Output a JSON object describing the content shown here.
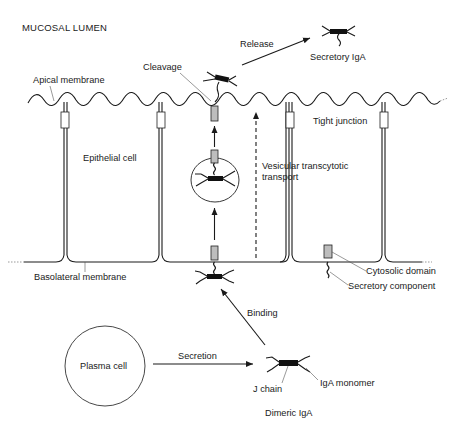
{
  "regions": {
    "lumen": "MUCOSAL LUMEN"
  },
  "labels": {
    "apical_membrane": "Apical membrane",
    "cleavage": "Cleavage",
    "release": "Release",
    "secretory_iga": "Secretory IgA",
    "tight_junction": "Tight junction",
    "epithelial_cell": "Epithelial cell",
    "vesicular_line1": "Vesicular transcytotic",
    "vesicular_line2": "transport",
    "basolateral_membrane": "Basolateral membrane",
    "cytosolic_domain": "Cytosolic domain",
    "secretory_component": "Secretory component",
    "binding": "Binding",
    "plasma_cell": "Plasma cell",
    "secretion": "Secretion",
    "j_chain": "J chain",
    "iga_monomer": "IgA monomer",
    "dimeric_iga": "Dimeric IgA"
  },
  "colors": {
    "ink": "#1a1a1a",
    "secretory_component_fill": "#bdbdbd",
    "background": "#ffffff"
  }
}
